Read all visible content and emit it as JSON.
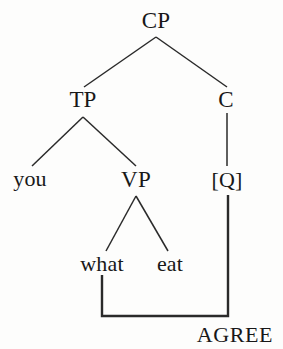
{
  "figure": {
    "kind": "syntax-tree",
    "caption": "",
    "background_color": "#fdfdfc",
    "line_color": "#2a2a2a",
    "text_color": "#181818"
  },
  "nodes": {
    "cp": {
      "label": "CP",
      "x": 156,
      "y": 20
    },
    "tp": {
      "label": "TP",
      "x": 83,
      "y": 99
    },
    "c": {
      "label": "C",
      "x": 226,
      "y": 99
    },
    "you": {
      "label": "you",
      "x": 30,
      "y": 179
    },
    "vp": {
      "label": "VP",
      "x": 136,
      "y": 179
    },
    "q": {
      "label": "[Q]",
      "x": 227,
      "y": 180
    },
    "what": {
      "label": "what",
      "x": 102,
      "y": 264
    },
    "eat": {
      "label": "eat",
      "x": 170,
      "y": 264
    },
    "agree": {
      "label": "AGREE",
      "x": 235,
      "y": 335
    }
  },
  "branches": [
    {
      "name": "cp-to-tp",
      "x1": 156,
      "y1": 37,
      "x2": 84,
      "y2": 87
    },
    {
      "name": "cp-to-c",
      "x1": 156,
      "y1": 37,
      "x2": 227,
      "y2": 87
    },
    {
      "name": "tp-to-you",
      "x1": 83,
      "y1": 117,
      "x2": 32,
      "y2": 166
    },
    {
      "name": "tp-to-vp",
      "x1": 83,
      "y1": 117,
      "x2": 136,
      "y2": 166
    },
    {
      "name": "c-to-q",
      "x1": 227,
      "y1": 113,
      "x2": 227,
      "y2": 166
    },
    {
      "name": "vp-to-what",
      "x1": 136,
      "y1": 196,
      "x2": 106,
      "y2": 251
    },
    {
      "name": "vp-to-eat",
      "x1": 136,
      "y1": 196,
      "x2": 168,
      "y2": 251
    }
  ],
  "agree_link": {
    "name": "agree-bracket",
    "points": "102,275 102,316 228,316 228,195",
    "from": "what",
    "to": "[Q]",
    "label": "AGREE"
  }
}
